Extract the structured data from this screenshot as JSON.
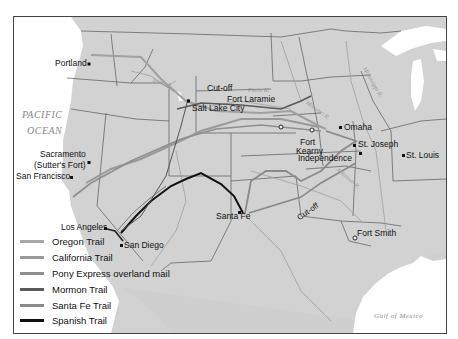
{
  "map": {
    "ocean_labels": [
      "PACIFIC",
      "OCEAN"
    ],
    "gulf_label": "Gulf of Mexico",
    "rivers": {
      "snake": "Snake R.",
      "platte": "Platte R.",
      "missouri": "Missouri R.",
      "mississippi": "Mississippi R.",
      "arkansas": "Arkansas R.",
      "colorado": "Colorado R.",
      "great_salt_lake": "Great Salt Lake"
    },
    "cities": {
      "portland": "Portland",
      "sacramento_line1": "Sacramento",
      "sacramento_line2": "(Sutter's Fort)",
      "san_francisco": "San Francisco",
      "los_angeles": "Los Angeles",
      "san_diego": "San Diego",
      "salt_lake_city": "Salt Lake City",
      "santa_fe": "Santa Fe",
      "fort_laramie": "Fort Laramie",
      "fort_kearny_line1": "Fort",
      "fort_kearny_line2": "Kearny",
      "omaha": "Omaha",
      "st_joseph": "St. Joseph",
      "independence": "Independence",
      "st_louis": "St. Louis",
      "fort_smith": "Fort Smith"
    },
    "annotations": {
      "cutoff_north": "Cut-off",
      "cutoff_south": "Cut-off"
    }
  },
  "legend": {
    "items": [
      {
        "label": "Oregon Trail",
        "color": "#a8a8a8"
      },
      {
        "label": "California Trail",
        "color": "#9a9a9a"
      },
      {
        "label": "Pony Express overland mail",
        "color": "#8f8f8f"
      },
      {
        "label": "Mormon Trail",
        "color": "#5a5a5a"
      },
      {
        "label": "Santa Fe Trail",
        "color": "#8a8a8a"
      },
      {
        "label": "Spanish Trail",
        "color": "#111111"
      }
    ]
  },
  "colors": {
    "land": "#d4d4d4",
    "water": "#ffffff",
    "border": "#555555"
  }
}
